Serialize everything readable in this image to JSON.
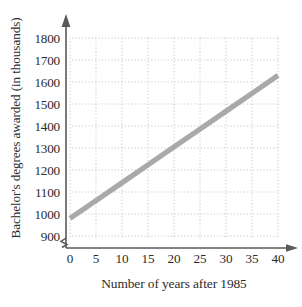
{
  "chart_data": {
    "type": "line",
    "title": "",
    "xlabel": "Number of years after 1985",
    "ylabel": "Bachelor's degrees awarded (in thousands)",
    "xlim": [
      0,
      40
    ],
    "ylim": [
      850,
      1850
    ],
    "y_axis_break": true,
    "grid": true,
    "legend": "none",
    "xticks": [
      0,
      5,
      10,
      15,
      20,
      25,
      30,
      35,
      40
    ],
    "xtick_labels": [
      "0",
      "5",
      "10",
      "15",
      "20",
      "25",
      "30",
      "35",
      "40"
    ],
    "yticks": [
      900,
      1000,
      1100,
      1200,
      1300,
      1400,
      1500,
      1600,
      1700,
      1800
    ],
    "ytick_labels": [
      "900",
      "1000",
      "1100",
      "1200",
      "1300",
      "1400",
      "1500",
      "1600",
      "1700",
      "1800"
    ],
    "series": [
      {
        "name": "Bachelor's degrees awarded",
        "color": "#a9a9a9",
        "x": [
          0,
          5,
          10,
          15,
          20,
          25,
          30,
          35,
          40
        ],
        "values": [
          980,
          1061,
          1142,
          1223,
          1305,
          1386,
          1467,
          1548,
          1630
        ]
      }
    ]
  },
  "colors": {
    "line": "#a9a9a9",
    "axis": "#595959",
    "grid": "#c8c8c8",
    "text": "#2b2b2b",
    "background": "#ffffff"
  },
  "icons": {
    "y_axis_arrow": "arrow-up-icon",
    "x_axis_arrow": "arrow-right-icon",
    "axis_break": "axis-break-zigzag-icon"
  }
}
